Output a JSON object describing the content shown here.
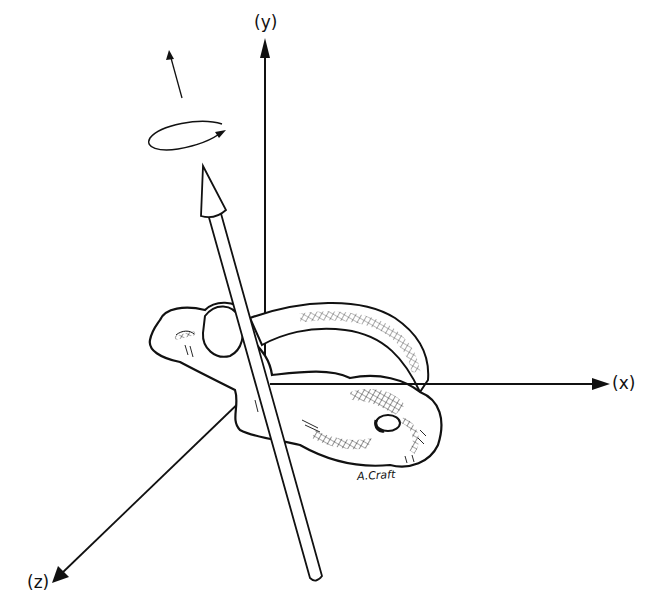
{
  "diagram": {
    "axes": {
      "y_label": "(y)",
      "x_label": "(x)",
      "z_label": "(z)"
    },
    "signature": "A.Craft",
    "colors": {
      "ink": "#111111",
      "background": "#ffffff"
    }
  }
}
